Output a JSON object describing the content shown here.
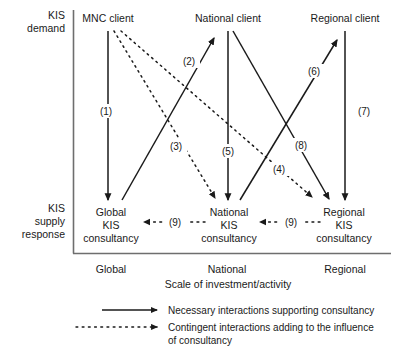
{
  "figure": {
    "axis": {
      "x_title": "Scale of investment/activity",
      "x_ticks": [
        "Global",
        "National",
        "Regional"
      ],
      "y_labels": [
        {
          "line1": "KIS",
          "line2": "demand",
          "line3": ""
        },
        {
          "line1": "KIS",
          "line2": "supply",
          "line3": "response"
        }
      ]
    },
    "demand_nodes": [
      {
        "id": "mnc-client",
        "label": "MNC client"
      },
      {
        "id": "national-client",
        "label": "National client"
      },
      {
        "id": "regional-client",
        "label": "Regional client"
      }
    ],
    "supply_nodes": [
      {
        "id": "global-kis-consultancy",
        "line1": "Global",
        "line2": "KIS",
        "line3": "consultancy"
      },
      {
        "id": "national-kis-consultancy",
        "line1": "National",
        "line2": "KIS",
        "line3": "consultancy"
      },
      {
        "id": "regional-kis-consultancy",
        "line1": "Regional",
        "line2": "KIS",
        "line3": "consultancy"
      }
    ],
    "edge_labels": {
      "e1": "(1)",
      "e2": "(2)",
      "e3": "(3)",
      "e4": "(4)",
      "e5": "(5)",
      "e6": "(6)",
      "e7": "(7)",
      "e8": "(8)",
      "e9a": "(9)",
      "e9b": "(9)"
    },
    "legend": [
      {
        "style": "solid",
        "text_line1": "Necessary interactions supporting consultancy",
        "text_line2": ""
      },
      {
        "style": "dotted",
        "text_line1": "Contingent interactions adding to the influence",
        "text_line2": "of consultancy"
      }
    ],
    "colors": {
      "ink": "#1a1a1a",
      "axis": "#6e6e6e",
      "background": "#ffffff"
    }
  }
}
